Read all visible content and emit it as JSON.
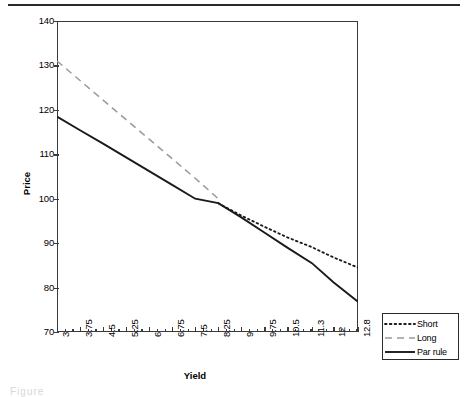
{
  "figure": {
    "top_rule": "",
    "caption_remnant": "Figure"
  },
  "chart_data": {
    "type": "line",
    "title": "",
    "xlabel": "Yield",
    "ylabel": "Price",
    "xlim": [
      3,
      12.8
    ],
    "ylim": [
      70,
      140
    ],
    "yticks": [
      140,
      130,
      120,
      110,
      100,
      90,
      80,
      70
    ],
    "grid": false,
    "legend_position": "right-bottom-outside",
    "categories": [
      3,
      3.75,
      4.5,
      5.25,
      6,
      6.75,
      7.5,
      8.25,
      9,
      9.75,
      10.5,
      11.3,
      12,
      12.8
    ],
    "xtick_labels": [
      "3",
      "3.75",
      "4.5",
      "5.25",
      "6",
      "6.75",
      "7.5",
      "8.25",
      "9",
      "9.75",
      "10.5",
      "11.3",
      "12",
      "12.8"
    ],
    "series": [
      {
        "name": "Short",
        "style": "dotted",
        "color": "#1a1a1a",
        "values": [
          null,
          null,
          null,
          null,
          null,
          null,
          null,
          99.0,
          96.2,
          93.7,
          91.3,
          89.1,
          86.8,
          84.5
        ]
      },
      {
        "name": "Long",
        "style": "dashed",
        "color": "#9a9a9a",
        "values": [
          131.0,
          126.6,
          122.2,
          117.8,
          113.4,
          109.0,
          104.6,
          100.0,
          null,
          null,
          null,
          null,
          null,
          null
        ]
      },
      {
        "name": "Par rule",
        "style": "solid",
        "color": "#1a1a1a",
        "values": [
          118.5,
          115.4,
          112.4,
          109.3,
          106.2,
          103.1,
          100.0,
          99.0,
          95.8,
          92.4,
          89.0,
          85.5,
          81.2,
          76.8
        ]
      }
    ]
  },
  "legend": {
    "items": [
      {
        "label": "Short",
        "style": "dotted",
        "color": "#1a1a1a"
      },
      {
        "label": "Long",
        "style": "dashed",
        "color": "#9a9a9a"
      },
      {
        "label": "Par rule",
        "style": "solid",
        "color": "#1a1a1a"
      }
    ]
  }
}
